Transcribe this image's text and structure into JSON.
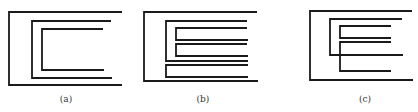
{
  "figure": {
    "panels": [
      {
        "label": "(a)",
        "label_pos": [
          66,
          94
        ],
        "paths": [
          "M122,12 L9,12 L9,85 L122,85",
          "M111,21 L32,21 L32,78 L112,78",
          "M103,29 L42,29 L42,70 L104,70"
        ]
      },
      {
        "label": "(b)",
        "label_pos": [
          203,
          94
        ],
        "paths": [
          "M257,12 L144,12 L144,81 L258,81",
          "M247,21 L166,21 L166,61 L248,61",
          "M247,28 L176,28 L176,40 L248,40",
          "M247,44 L176,44 L176,56 L248,56",
          "M248,65 L166,65 L166,77 L248,77"
        ]
      },
      {
        "label": "(c)",
        "label_pos": [
          365,
          94
        ],
        "paths": [
          "M412,11 L310,11 L310,80 L413,80",
          "M402,19 L330,19 L330,55 L403,55",
          "M391,26 L340,26 L340,38 L391,38",
          "M391,42 L340,42 L340,71 L391,71"
        ]
      }
    ],
    "stroke_color": "#1a1a1a",
    "background": "#ffffff"
  }
}
